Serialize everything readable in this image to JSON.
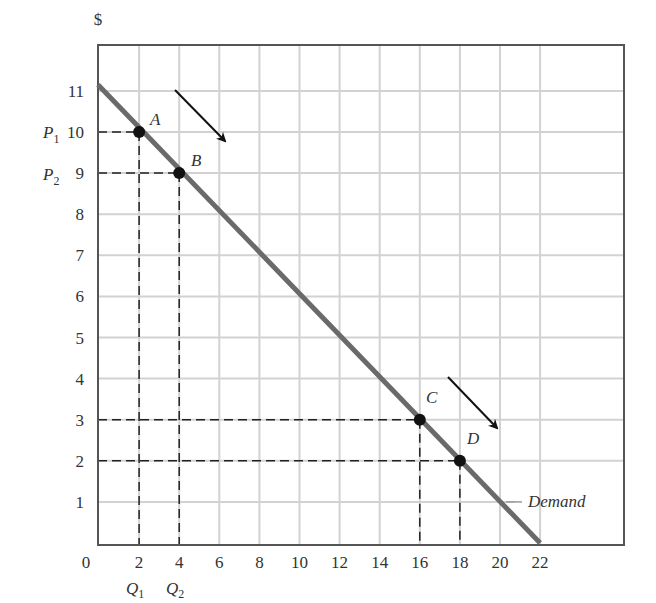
{
  "chart_data": {
    "type": "line",
    "title": "",
    "xlabel": "",
    "ylabel": "Unit price ($)",
    "y_unit_label": "$",
    "x_ticks": [
      0,
      2,
      4,
      6,
      8,
      10,
      12,
      14,
      16,
      18,
      20,
      22
    ],
    "y_ticks": [
      1,
      2,
      3,
      4,
      5,
      6,
      7,
      8,
      9,
      10,
      11
    ],
    "xlim": [
      0,
      26
    ],
    "ylim": [
      0,
      12
    ],
    "grid": true,
    "series": [
      {
        "name": "Demand",
        "x": [
          0,
          22
        ],
        "y": [
          11,
          0
        ],
        "color": "#6a6a6a"
      }
    ],
    "points": [
      {
        "label": "A",
        "x": 2,
        "y": 10
      },
      {
        "label": "B",
        "x": 4,
        "y": 9
      },
      {
        "label": "C",
        "x": 16,
        "y": 3
      },
      {
        "label": "D",
        "x": 18,
        "y": 2
      }
    ],
    "annotations": {
      "price_labels": [
        {
          "name": "P",
          "sub": "1",
          "y": 10
        },
        {
          "name": "P",
          "sub": "2",
          "y": 9
        }
      ],
      "quantity_labels": [
        {
          "name": "Q",
          "sub": "1",
          "x": 2
        },
        {
          "name": "Q",
          "sub": "2",
          "x": 4
        }
      ],
      "arrows": [
        {
          "from": [
            3,
            11
          ],
          "to": [
            5.5,
            9.7
          ]
        },
        {
          "from": [
            17.4,
            4
          ],
          "to": [
            19.9,
            2.7
          ]
        }
      ],
      "demand_label": "Demand"
    }
  },
  "labels": {
    "dollar": "$",
    "zero": "0",
    "demand": "Demand",
    "A": "A",
    "B": "B",
    "C": "C",
    "D": "D",
    "P": "P",
    "Q": "Q",
    "sub1": "1",
    "sub2": "2"
  }
}
